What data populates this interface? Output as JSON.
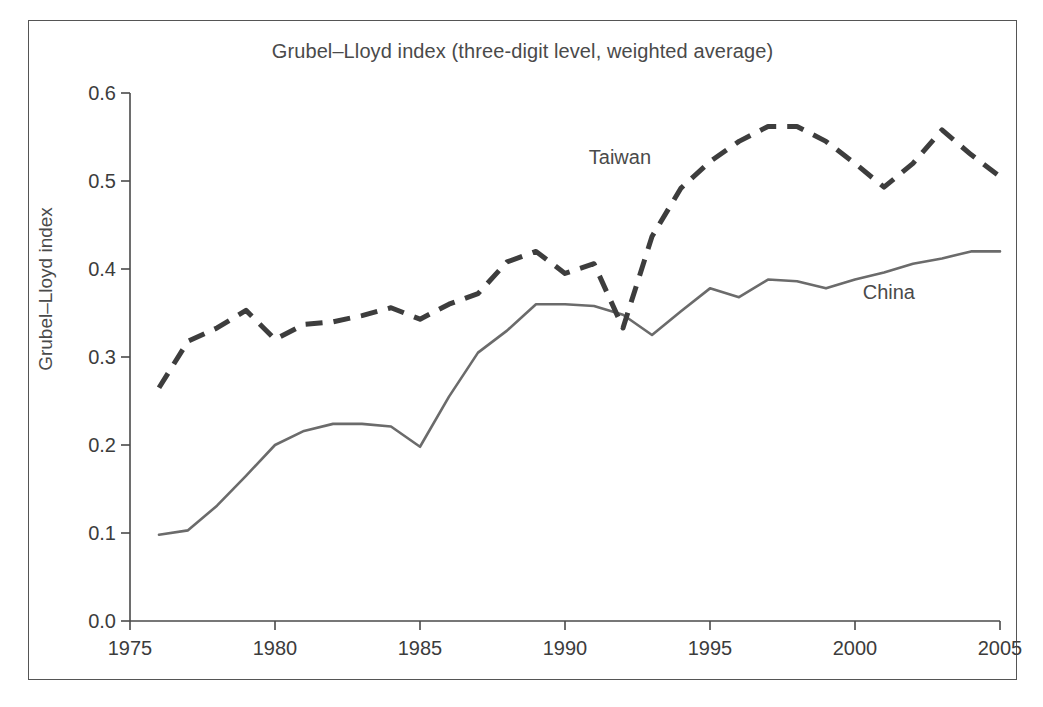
{
  "chart_data": {
    "type": "line",
    "title": "Grubel–Lloyd index (three-digit level, weighted average)",
    "xlabel": "",
    "ylabel": "Grubel–Lloyd index",
    "xlim": [
      1975,
      2005
    ],
    "ylim": [
      0.0,
      0.6
    ],
    "grid": false,
    "legend_position": "inline-annotations",
    "x_ticks": [
      "1975",
      "1980",
      "1985",
      "1990",
      "1995",
      "2000",
      "2005"
    ],
    "y_ticks": [
      "0.0",
      "0.1",
      "0.2",
      "0.3",
      "0.4",
      "0.5",
      "0.6"
    ],
    "x": [
      1976,
      1977,
      1978,
      1979,
      1980,
      1981,
      1982,
      1983,
      1984,
      1985,
      1986,
      1987,
      1988,
      1989,
      1990,
      1991,
      1992,
      1993,
      1994,
      1995,
      1996,
      1997,
      1998,
      1999,
      2000,
      2001,
      2002,
      2003,
      2004,
      2005
    ],
    "series": [
      {
        "name": "Taiwan",
        "style": "dashed",
        "color": "#3d3d3d",
        "values": [
          0.265,
          0.318,
          0.333,
          0.353,
          0.32,
          0.337,
          0.34,
          0.347,
          0.356,
          0.343,
          0.36,
          0.372,
          0.408,
          0.42,
          0.395,
          0.406,
          0.333,
          0.437,
          0.492,
          0.522,
          0.545,
          0.562,
          0.562,
          0.545,
          0.52,
          0.493,
          0.52,
          0.558,
          0.53,
          0.505
        ]
      },
      {
        "name": "China",
        "style": "solid",
        "color": "#6b6b6b",
        "values": [
          0.098,
          0.103,
          0.131,
          0.165,
          0.2,
          0.216,
          0.224,
          0.224,
          0.221,
          0.198,
          0.255,
          0.305,
          0.33,
          0.36,
          0.36,
          0.358,
          0.348,
          0.325,
          0.352,
          0.378,
          0.368,
          0.388,
          0.386,
          0.378,
          0.388,
          0.396,
          0.406,
          0.412,
          0.42,
          0.42
        ]
      }
    ],
    "annotations": [
      {
        "text": "Taiwan",
        "x": 1992.2,
        "y": 0.525
      },
      {
        "text": "China",
        "x": 2001.3,
        "y": 0.372
      }
    ]
  }
}
